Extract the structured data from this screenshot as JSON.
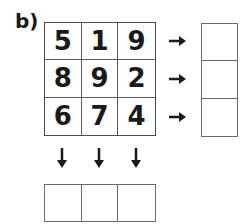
{
  "label": "b)",
  "grid": {
    "rows": [
      [
        "5",
        "1",
        "9"
      ],
      [
        "8",
        "9",
        "2"
      ],
      [
        "6",
        "7",
        "4"
      ]
    ]
  },
  "arrows": {
    "right_icon": "arrow-right-icon",
    "down_icon": "arrow-down-icon"
  },
  "row_answers": [
    "",
    "",
    ""
  ],
  "column_answers": [
    "",
    "",
    ""
  ]
}
